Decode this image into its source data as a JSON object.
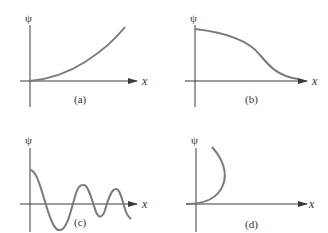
{
  "figure": {
    "panels": [
      {
        "id": "a",
        "label": "(a)",
        "y_axis_label": "ψ",
        "x_axis_label": "x",
        "curve": "increasing-concave-up"
      },
      {
        "id": "b",
        "label": "(b)",
        "y_axis_label": "ψ",
        "x_axis_label": "x",
        "curve": "decreasing-sigmoid"
      },
      {
        "id": "c",
        "label": "(c)",
        "y_axis_label": "ψ",
        "x_axis_label": "x",
        "curve": "damped-oscillation"
      },
      {
        "id": "d",
        "label": "(d)",
        "y_axis_label": "ψ",
        "x_axis_label": "x",
        "curve": "double-valued-arc"
      }
    ],
    "colors": {
      "axis": "#3a3a3a",
      "curve": "#7a7a7a",
      "text": "#333333"
    }
  }
}
